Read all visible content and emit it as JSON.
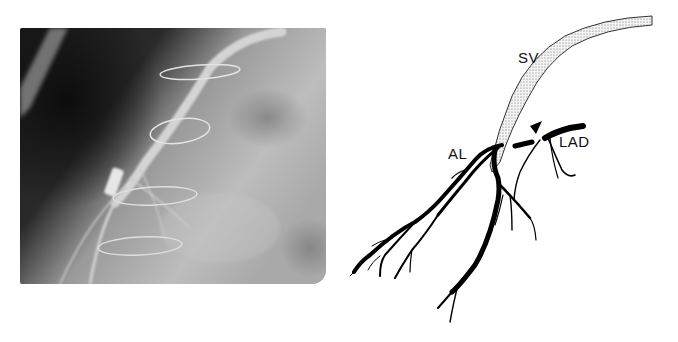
{
  "figure": {
    "left_panel": {
      "type": "angiogram-photograph",
      "description": "Radiographic angiogram showing saphenous vein graft with surgical wire loops"
    },
    "right_panel": {
      "type": "schematic-drawing",
      "labels": {
        "sv": "SV",
        "al": "AL",
        "lad": "LAD"
      },
      "markers": [
        "arrowhead"
      ]
    },
    "colors": {
      "vessel": "#000000",
      "graft_fill": "#d9d9d9",
      "background": "#ffffff"
    }
  }
}
